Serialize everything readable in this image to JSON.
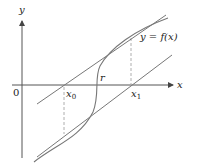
{
  "diagram": {
    "axes": {
      "x_label": "x",
      "y_label": "y",
      "origin_label": "0"
    },
    "points": {
      "x0": "x",
      "x0_sub": "0",
      "x1": "x",
      "x1_sub": "1",
      "root": "r"
    },
    "curve_label": "y = f(x)",
    "colors": {
      "axis": "#555555",
      "curve": "#777777",
      "dashed": "#999999"
    }
  }
}
